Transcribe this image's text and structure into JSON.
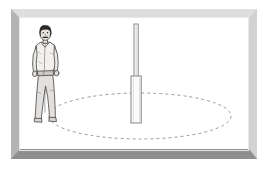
{
  "scene": {
    "title": "Man standing beside a vertical pole inside a dashed ellipse",
    "width": 268,
    "height": 169,
    "background_color": "#ffffff",
    "caption": ""
  },
  "frame": {
    "name": "beveled-picture-frame",
    "top_color": "#dedede",
    "left_color": "#b4b4b4",
    "right_color": "#d2d2d2",
    "bottom_color": "#8e8e8e",
    "border_top": 9,
    "border_left": 9,
    "border_right": 8,
    "border_bottom": 10
  },
  "figure": {
    "name": "standing-man",
    "label": "man",
    "hair_color": "#2b2b2b",
    "skin_color": "#e6ded8",
    "shirt_color": "#f2f0ed",
    "trousers_color": "#e2dedb",
    "outline_color": "#4a4a4a",
    "center_x": 46,
    "head_top_y": 26,
    "feet_y": 122
  },
  "pole": {
    "name": "vertical-pole",
    "label": "pole",
    "rod_top_y": 24,
    "rod_bottom_y": 77,
    "rod_width": 4,
    "base_top_y": 76,
    "base_bottom_y": 123,
    "base_width": 10,
    "center_x": 136,
    "fill_color": "#fbfbfb",
    "outline_color": "#7d7d7d"
  },
  "ellipse": {
    "name": "dashed-ground-ellipse",
    "label": "dashed ellipse",
    "center_x": 140,
    "center_y": 116,
    "radius_x": 91,
    "radius_y": 23,
    "stroke_color": "#9a9a9a",
    "dash_pattern": "3 3",
    "stroke_width": 1
  }
}
